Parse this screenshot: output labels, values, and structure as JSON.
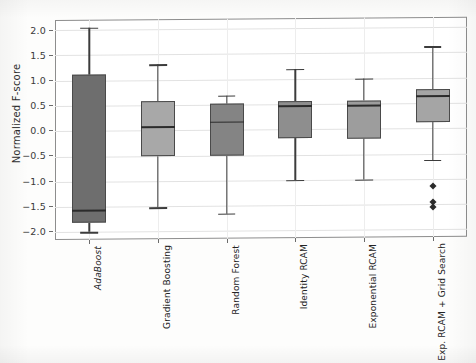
{
  "scan_header": {
    "fragment_left": "",
    "fragment_right": ""
  },
  "chart_data": {
    "type": "box",
    "title": "",
    "xlabel": "",
    "ylabel": "Normalized F-score",
    "ylim": [
      -2.15,
      2.2
    ],
    "yticks": [
      2.0,
      1.5,
      1.0,
      0.5,
      0.0,
      -0.5,
      -1.0,
      -1.5,
      -2.0
    ],
    "ytick_labels": [
      "2.0",
      "1.5",
      "1.0",
      "0.5",
      "0.0",
      "−0.5",
      "−1.0",
      "−1.5",
      "−2.0"
    ],
    "grid": true,
    "grid_axis": "both",
    "legend": null,
    "categories": [
      "AdaBoost",
      "Gradient Boosting",
      "Random Forest",
      "Identity RCAM",
      "Exponential RCAM",
      "Exp. RCAM + Grid Search"
    ],
    "category_styles": [
      {
        "emphasis": "italic"
      },
      {
        "emphasis": "normal"
      },
      {
        "emphasis": "normal"
      },
      {
        "emphasis": "normal"
      },
      {
        "emphasis": "normal"
      },
      {
        "emphasis": "normal"
      }
    ],
    "boxes": [
      {
        "label": "AdaBoost",
        "whisker_low": -2.0,
        "q1": -1.82,
        "median": -1.56,
        "q3": 1.12,
        "whisker_high": 2.05,
        "outliers": [],
        "fill": "#6e6e6e",
        "edge": "#4a4a4a"
      },
      {
        "label": "Gradient Boosting",
        "whisker_low": -1.52,
        "q1": -0.5,
        "median": 0.08,
        "q3": 0.58,
        "whisker_high": 1.31,
        "outliers": [],
        "fill": "#a8a8a8",
        "edge": "#4a4a4a"
      },
      {
        "label": "Random Forest",
        "whisker_low": -1.65,
        "q1": -0.5,
        "median": 0.17,
        "q3": 0.52,
        "whisker_high": 0.68,
        "outliers": [],
        "fill": "#848484",
        "edge": "#4a4a4a"
      },
      {
        "label": "Identity RCAM",
        "whisker_low": -1.0,
        "q1": -0.18,
        "median": 0.48,
        "q3": 0.55,
        "whisker_high": 1.2,
        "outliers": [],
        "fill": "#8e8e8e",
        "edge": "#4a4a4a"
      },
      {
        "label": "Exponential RCAM",
        "whisker_low": -1.0,
        "q1": -0.2,
        "median": 0.48,
        "q3": 0.55,
        "whisker_high": 1.0,
        "outliers": [],
        "fill": "#9d9d9d",
        "edge": "#4a4a4a"
      },
      {
        "label": "Exp. RCAM + Grid Search",
        "whisker_low": -0.62,
        "q1": 0.12,
        "median": 0.65,
        "q3": 0.78,
        "whisker_high": 1.62,
        "outliers": [
          -1.15,
          -1.45,
          -1.56
        ],
        "fill": "#a5a5a5",
        "edge": "#4a4a4a"
      }
    ],
    "colors": {
      "axes_edge": "#8d8d8d",
      "grid": "#e2e2e2",
      "whisker": "#3c3c3c",
      "median": "#2b2b2b",
      "outlier": "#2b2b2b",
      "text": "#2e2e2e",
      "background": "#ffffff"
    }
  }
}
